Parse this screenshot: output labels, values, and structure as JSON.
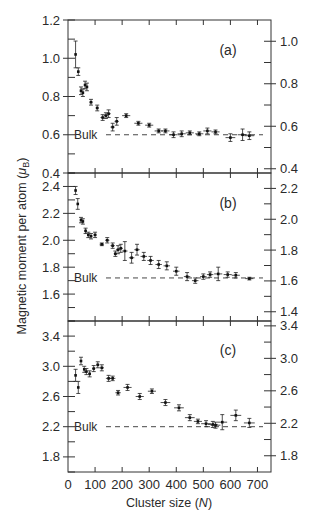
{
  "chart_data": {
    "type": "scatter",
    "layout": "three vertically stacked panels sharing x-axis, each with left and right y-axes, error bars, dashed bulk reference line",
    "xlabel": "Cluster size (N)",
    "ylabel": "Magnetic moment per atom (μB)",
    "x_ticks": [
      0,
      100,
      200,
      300,
      400,
      500,
      600,
      700
    ],
    "xlim": [
      0,
      750
    ],
    "grid": false,
    "panels": [
      {
        "label": "(a)",
        "bulk_label": "Bulk",
        "bulk_value": 0.6,
        "left_ylim": [
          0.4,
          1.2
        ],
        "left_ticks": [
          0.4,
          0.6,
          0.8,
          1.0,
          1.2
        ],
        "right_ylim": [
          0.38,
          1.1
        ],
        "right_ticks": [
          0.4,
          0.6,
          0.8,
          1.0
        ],
        "points": [
          {
            "x": 28,
            "y": 1.02,
            "xerr": 0,
            "yerr": 0.07
          },
          {
            "x": 38,
            "y": 0.93,
            "xerr": 3,
            "yerr": 0.02
          },
          {
            "x": 48,
            "y": 0.83,
            "xerr": 3,
            "yerr": 0.02
          },
          {
            "x": 55,
            "y": 0.82,
            "xerr": 3,
            "yerr": 0.02
          },
          {
            "x": 63,
            "y": 0.86,
            "xerr": 4,
            "yerr": 0.02
          },
          {
            "x": 70,
            "y": 0.85,
            "xerr": 4,
            "yerr": 0.02
          },
          {
            "x": 85,
            "y": 0.77,
            "xerr": 6,
            "yerr": 0.015
          },
          {
            "x": 108,
            "y": 0.74,
            "xerr": 6,
            "yerr": 0.015
          },
          {
            "x": 128,
            "y": 0.69,
            "xerr": 8,
            "yerr": 0.015
          },
          {
            "x": 140,
            "y": 0.7,
            "xerr": 8,
            "yerr": 0.015
          },
          {
            "x": 150,
            "y": 0.71,
            "xerr": 8,
            "yerr": 0.02
          },
          {
            "x": 165,
            "y": 0.64,
            "xerr": 8,
            "yerr": 0.02
          },
          {
            "x": 180,
            "y": 0.67,
            "xerr": 8,
            "yerr": 0.02
          },
          {
            "x": 215,
            "y": 0.7,
            "xerr": 15,
            "yerr": 0.01
          },
          {
            "x": 260,
            "y": 0.66,
            "xerr": 15,
            "yerr": 0.01
          },
          {
            "x": 300,
            "y": 0.65,
            "xerr": 15,
            "yerr": 0.01
          },
          {
            "x": 335,
            "y": 0.62,
            "xerr": 15,
            "yerr": 0.01
          },
          {
            "x": 360,
            "y": 0.62,
            "xerr": 15,
            "yerr": 0.01
          },
          {
            "x": 390,
            "y": 0.6,
            "xerr": 15,
            "yerr": 0.015
          },
          {
            "x": 420,
            "y": 0.605,
            "xerr": 15,
            "yerr": 0.015
          },
          {
            "x": 450,
            "y": 0.61,
            "xerr": 15,
            "yerr": 0.01
          },
          {
            "x": 485,
            "y": 0.605,
            "xerr": 15,
            "yerr": 0.01
          },
          {
            "x": 515,
            "y": 0.62,
            "xerr": 15,
            "yerr": 0.015
          },
          {
            "x": 545,
            "y": 0.615,
            "xerr": 15,
            "yerr": 0.01
          },
          {
            "x": 600,
            "y": 0.585,
            "xerr": 18,
            "yerr": 0.02
          },
          {
            "x": 645,
            "y": 0.6,
            "xerr": 18,
            "yerr": 0.03
          },
          {
            "x": 670,
            "y": 0.595,
            "xerr": 18,
            "yerr": 0.02
          }
        ]
      },
      {
        "label": "(b)",
        "bulk_label": "Bulk",
        "bulk_value": 1.72,
        "left_ylim": [
          1.4,
          2.5
        ],
        "left_ticks": [
          1.6,
          1.8,
          2.0,
          2.2,
          2.4
        ],
        "right_ylim": [
          1.34,
          2.3
        ],
        "right_ticks": [
          1.4,
          1.6,
          1.8,
          2.0,
          2.2
        ],
        "points": [
          {
            "x": 28,
            "y": 2.37,
            "xerr": 0,
            "yerr": 0.03
          },
          {
            "x": 36,
            "y": 2.27,
            "xerr": 0,
            "yerr": 0.04
          },
          {
            "x": 48,
            "y": 2.15,
            "xerr": 3,
            "yerr": 0.02
          },
          {
            "x": 55,
            "y": 2.14,
            "xerr": 3,
            "yerr": 0.02
          },
          {
            "x": 65,
            "y": 2.07,
            "xerr": 4,
            "yerr": 0.02
          },
          {
            "x": 75,
            "y": 2.04,
            "xerr": 5,
            "yerr": 0.02
          },
          {
            "x": 85,
            "y": 2.03,
            "xerr": 5,
            "yerr": 0.02
          },
          {
            "x": 100,
            "y": 2.04,
            "xerr": 6,
            "yerr": 0.02
          },
          {
            "x": 125,
            "y": 1.97,
            "xerr": 8,
            "yerr": 0.01
          },
          {
            "x": 145,
            "y": 2.0,
            "xerr": 8,
            "yerr": 0.02
          },
          {
            "x": 165,
            "y": 1.96,
            "xerr": 8,
            "yerr": 0.02
          },
          {
            "x": 175,
            "y": 1.9,
            "xerr": 6,
            "yerr": 0.02
          },
          {
            "x": 185,
            "y": 1.93,
            "xerr": 8,
            "yerr": 0.03
          },
          {
            "x": 195,
            "y": 1.94,
            "xerr": 8,
            "yerr": 0.03
          },
          {
            "x": 210,
            "y": 1.92,
            "xerr": 10,
            "yerr": 0.07
          },
          {
            "x": 235,
            "y": 1.87,
            "xerr": 10,
            "yerr": 0.04
          },
          {
            "x": 255,
            "y": 1.93,
            "xerr": 10,
            "yerr": 0.04
          },
          {
            "x": 280,
            "y": 1.88,
            "xerr": 12,
            "yerr": 0.03
          },
          {
            "x": 305,
            "y": 1.85,
            "xerr": 12,
            "yerr": 0.03
          },
          {
            "x": 335,
            "y": 1.82,
            "xerr": 12,
            "yerr": 0.03
          },
          {
            "x": 365,
            "y": 1.81,
            "xerr": 12,
            "yerr": 0.03
          },
          {
            "x": 400,
            "y": 1.77,
            "xerr": 12,
            "yerr": 0.03
          },
          {
            "x": 440,
            "y": 1.73,
            "xerr": 12,
            "yerr": 0.03
          },
          {
            "x": 470,
            "y": 1.7,
            "xerr": 12,
            "yerr": 0.02
          },
          {
            "x": 500,
            "y": 1.73,
            "xerr": 12,
            "yerr": 0.02
          },
          {
            "x": 525,
            "y": 1.745,
            "xerr": 12,
            "yerr": 0.02
          },
          {
            "x": 555,
            "y": 1.75,
            "xerr": 15,
            "yerr": 0.05
          },
          {
            "x": 590,
            "y": 1.745,
            "xerr": 15,
            "yerr": 0.02
          },
          {
            "x": 620,
            "y": 1.74,
            "xerr": 15,
            "yerr": 0.02
          },
          {
            "x": 670,
            "y": 1.715,
            "xerr": 15,
            "yerr": 0.01
          }
        ]
      },
      {
        "label": "(c)",
        "bulk_label": "Bulk",
        "bulk_value": 2.2,
        "left_ylim": [
          1.6,
          3.6
        ],
        "left_ticks": [
          1.8,
          2.2,
          2.6,
          3.0,
          3.4
        ],
        "right_ylim": [
          1.6,
          3.46
        ],
        "right_ticks": [
          1.8,
          2.2,
          2.6,
          3.0,
          3.4
        ],
        "points": [
          {
            "x": 28,
            "y": 2.88,
            "xerr": 0,
            "yerr": 0.08
          },
          {
            "x": 38,
            "y": 2.72,
            "xerr": 0,
            "yerr": 0.08
          },
          {
            "x": 48,
            "y": 3.07,
            "xerr": 3,
            "yerr": 0.05
          },
          {
            "x": 60,
            "y": 2.96,
            "xerr": 4,
            "yerr": 0.04
          },
          {
            "x": 68,
            "y": 2.93,
            "xerr": 4,
            "yerr": 0.04
          },
          {
            "x": 80,
            "y": 2.9,
            "xerr": 5,
            "yerr": 0.04
          },
          {
            "x": 95,
            "y": 2.97,
            "xerr": 6,
            "yerr": 0.04
          },
          {
            "x": 110,
            "y": 3.02,
            "xerr": 6,
            "yerr": 0.04
          },
          {
            "x": 125,
            "y": 2.98,
            "xerr": 8,
            "yerr": 0.04
          },
          {
            "x": 150,
            "y": 2.84,
            "xerr": 10,
            "yerr": 0.04
          },
          {
            "x": 165,
            "y": 2.84,
            "xerr": 10,
            "yerr": 0.03
          },
          {
            "x": 185,
            "y": 2.65,
            "xerr": 10,
            "yerr": 0.03
          },
          {
            "x": 220,
            "y": 2.72,
            "xerr": 15,
            "yerr": 0.04
          },
          {
            "x": 265,
            "y": 2.6,
            "xerr": 15,
            "yerr": 0.04
          },
          {
            "x": 310,
            "y": 2.67,
            "xerr": 15,
            "yerr": 0.03
          },
          {
            "x": 360,
            "y": 2.52,
            "xerr": 18,
            "yerr": 0.04
          },
          {
            "x": 410,
            "y": 2.45,
            "xerr": 18,
            "yerr": 0.04
          },
          {
            "x": 450,
            "y": 2.32,
            "xerr": 18,
            "yerr": 0.04
          },
          {
            "x": 480,
            "y": 2.27,
            "xerr": 15,
            "yerr": 0.03
          },
          {
            "x": 510,
            "y": 2.24,
            "xerr": 18,
            "yerr": 0.04
          },
          {
            "x": 535,
            "y": 2.23,
            "xerr": 18,
            "yerr": 0.04
          },
          {
            "x": 545,
            "y": 2.22,
            "xerr": 18,
            "yerr": 0.04
          },
          {
            "x": 570,
            "y": 2.26,
            "xerr": 18,
            "yerr": 0.1
          },
          {
            "x": 620,
            "y": 2.35,
            "xerr": 20,
            "yerr": 0.07
          },
          {
            "x": 670,
            "y": 2.25,
            "xerr": 20,
            "yerr": 0.06
          }
        ]
      }
    ]
  },
  "labels": {
    "xlabel_main": "Cluster size (",
    "xlabel_var": "N",
    "xlabel_end": ")",
    "ylabel_main": "Magnetic moment per atom (",
    "ylabel_var": "μ",
    "ylabel_sub": "B",
    "ylabel_end": ")"
  }
}
